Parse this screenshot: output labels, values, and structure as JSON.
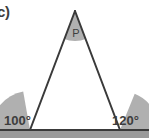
{
  "figure": {
    "part_label": "c)",
    "background_color": "#ffffff",
    "stroke_color": "#3a3a3a",
    "arc_fill_color": "#b0b0b0",
    "text_color": "#3d3d3d",
    "baseline_band_color": "#9a9a9a"
  },
  "triangle": {
    "name": "triangle-pqr",
    "apex": {
      "label": "P",
      "x": 75,
      "y": 11
    },
    "base_left": {
      "x": 30,
      "y": 130
    },
    "base_right": {
      "x": 120,
      "y": 130
    }
  },
  "angles": {
    "apex": {
      "name": "apex-angle",
      "label": "P",
      "label_x": 76,
      "label_y": 37
    },
    "exterior_left": {
      "name": "exterior-angle-left",
      "label": "100°",
      "label_x": 4,
      "label_y": 124
    },
    "exterior_right": {
      "name": "exterior-angle-right",
      "label": "120°",
      "label_x": 113,
      "label_y": 124
    }
  },
  "baseline": {
    "name": "baseline",
    "y": 130,
    "x_start": 0,
    "x_end": 149
  }
}
